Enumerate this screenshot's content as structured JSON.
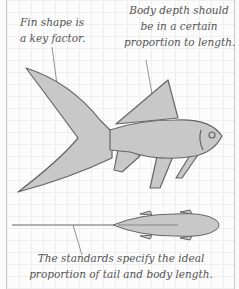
{
  "annotations": {
    "fin_shape": {
      "lines": [
        "Fin shape is",
        "a key factor."
      ]
    },
    "body_depth": {
      "lines": [
        "Body depth should",
        "be in a certain",
        "proportion to length."
      ]
    },
    "standards": {
      "lines": [
        "The standards specify the ideal",
        "proportion of tail and body length."
      ]
    }
  },
  "illustrations": {
    "side_view": "fish-side-view",
    "top_view": "fish-top-view"
  },
  "colors": {
    "fish_fill": "#c8c8c8",
    "fish_stroke": "#666666",
    "text": "#555555",
    "grid": "#efefef",
    "border": "#c9c9c9"
  }
}
